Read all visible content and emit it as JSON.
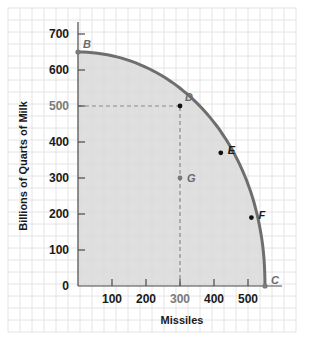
{
  "chart_data": {
    "type": "area",
    "title": "",
    "xlabel": "Missiles",
    "ylabel": "Billions of  Quarts of Milk",
    "xlim": [
      0,
      550
    ],
    "ylim": [
      0,
      700
    ],
    "xticks": [
      100,
      200,
      300,
      400,
      500
    ],
    "yticks": [
      0,
      100,
      200,
      300,
      400,
      500,
      600,
      700
    ],
    "grid": true,
    "legend": null,
    "series": [
      {
        "name": "Production possibilities frontier",
        "x": [
          0,
          300,
          420,
          510,
          550
        ],
        "y": [
          650,
          500,
          370,
          190,
          0
        ],
        "fill_below": true
      }
    ],
    "points": [
      {
        "label": "B",
        "x": 0,
        "y": 650
      },
      {
        "label": "D",
        "x": 300,
        "y": 500
      },
      {
        "label": "E",
        "x": 420,
        "y": 370
      },
      {
        "label": "F",
        "x": 510,
        "y": 190
      },
      {
        "label": "C",
        "x": 550,
        "y": 0
      },
      {
        "label": "G",
        "x": 300,
        "y": 300
      }
    ],
    "annotations": [
      {
        "type": "dashed-line",
        "from": [
          0,
          500
        ],
        "to": [
          300,
          500
        ]
      },
      {
        "type": "dashed-line",
        "from": [
          300,
          0
        ],
        "to": [
          300,
          500
        ]
      }
    ],
    "highlighted_ticks": {
      "x": [
        300
      ],
      "y": [
        500
      ]
    }
  },
  "colors": {
    "curve": "#6e6e6e",
    "fill": "#d9d9d9",
    "grid": "#e4e4e4",
    "axis": "#4a4a4a",
    "point_on_curve": "#111111",
    "point_endpoint": "#7a7a7a",
    "dashed": "#8a8a8a"
  }
}
